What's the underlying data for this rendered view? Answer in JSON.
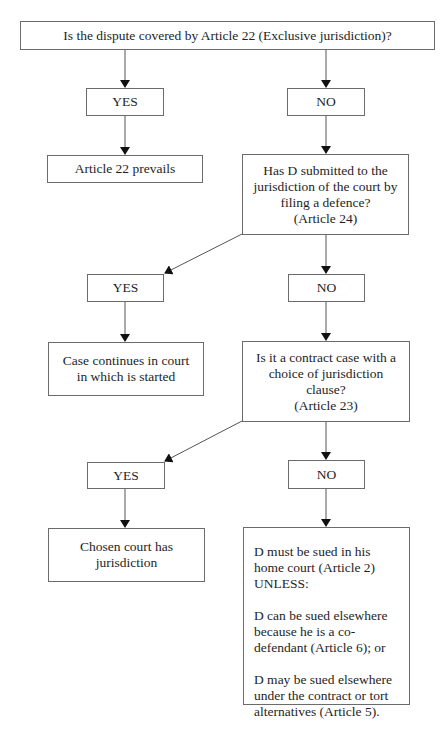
{
  "diagram": {
    "type": "flowchart",
    "nodes": {
      "q1": "Is the dispute covered by Article 22 (Exclusive jurisdiction)?",
      "yes1": "YES",
      "no1": "NO",
      "r1": "Article 22 prevails",
      "q2": "Has D submitted to the\njurisdiction of the court by\nfiling a defence?\n(Article 24)",
      "yes2": "YES",
      "no2": "NO",
      "r2": "Case continues in court\nin which is started",
      "q3": "Is it a contract case with a\nchoice of jurisdiction\nclause?\n(Article 23)",
      "yes3": "YES",
      "no3": "NO",
      "r3": "Chosen court has\njurisdiction",
      "final": [
        "D must be sued in his home court (Article 2) UNLESS:",
        "D can be sued elsewhere because he is a co-defendant (Article 6); or",
        "D may be sued elsewhere under the contract or tort alternatives (Article 5)."
      ]
    },
    "edges": [
      [
        "q1",
        "yes1"
      ],
      [
        "q1",
        "no1"
      ],
      [
        "yes1",
        "r1"
      ],
      [
        "no1",
        "q2"
      ],
      [
        "q2",
        "yes2"
      ],
      [
        "q2",
        "no2"
      ],
      [
        "yes2",
        "r2"
      ],
      [
        "no2",
        "q3"
      ],
      [
        "q3",
        "yes3"
      ],
      [
        "q3",
        "no3"
      ],
      [
        "yes3",
        "r3"
      ],
      [
        "no3",
        "final"
      ]
    ]
  }
}
